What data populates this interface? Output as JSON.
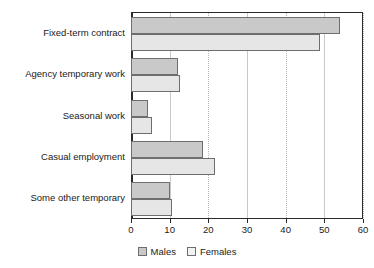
{
  "chart_data": {
    "type": "bar",
    "orientation": "horizontal",
    "title": "",
    "xlabel": "",
    "ylabel": "",
    "xlim": [
      0,
      60
    ],
    "xticks": [
      0,
      10,
      20,
      30,
      40,
      50,
      60
    ],
    "grid": true,
    "grid_axis": "x",
    "legend_position": "bottom-center",
    "categories": [
      "Fixed-term contract",
      "Agency temporary work",
      "Seasonal work",
      "Casual employment",
      "Some other temporary"
    ],
    "series": [
      {
        "name": "Males",
        "color": "#c9c9c9",
        "values": [
          54,
          12.2,
          4.4,
          18.7,
          10.2
        ]
      },
      {
        "name": "Females",
        "color": "#e6e6e6",
        "values": [
          49,
          12.7,
          5.4,
          21.6,
          10.7
        ]
      }
    ]
  },
  "legend": {
    "items": [
      {
        "label": "Males",
        "swatch": "males-swatch"
      },
      {
        "label": "Females",
        "swatch": "females-swatch"
      }
    ]
  }
}
